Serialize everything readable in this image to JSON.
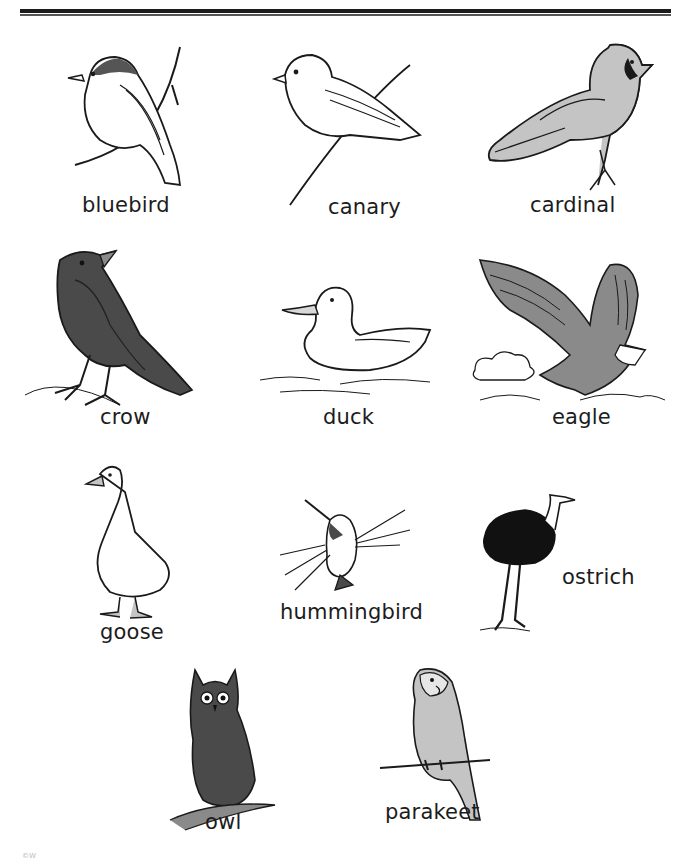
{
  "page": {
    "footer_mark": "©W"
  },
  "birds": [
    {
      "id": "bluebird",
      "label": "bluebird",
      "style": "line-art"
    },
    {
      "id": "canary",
      "label": "canary",
      "style": "line-art"
    },
    {
      "id": "cardinal",
      "label": "cardinal",
      "style": "gray-shaded"
    },
    {
      "id": "crow",
      "label": "crow",
      "style": "dark-shaded"
    },
    {
      "id": "duck",
      "label": "duck",
      "style": "line-art"
    },
    {
      "id": "eagle",
      "label": "eagle",
      "style": "gray-shaded"
    },
    {
      "id": "goose",
      "label": "goose",
      "style": "line-art"
    },
    {
      "id": "hummingbird",
      "label": "hummingbird",
      "style": "line-art"
    },
    {
      "id": "ostrich",
      "label": "ostrich",
      "style": "black-body"
    },
    {
      "id": "owl",
      "label": "owl",
      "style": "cross-hatched"
    },
    {
      "id": "parakeet",
      "label": "parakeet",
      "style": "gray-shaded"
    }
  ],
  "colors": {
    "ink": "#1a1a1a",
    "light_gray": "#c4c4c4",
    "mid_gray": "#8a8a8a",
    "dark_gray": "#4a4a4a"
  }
}
